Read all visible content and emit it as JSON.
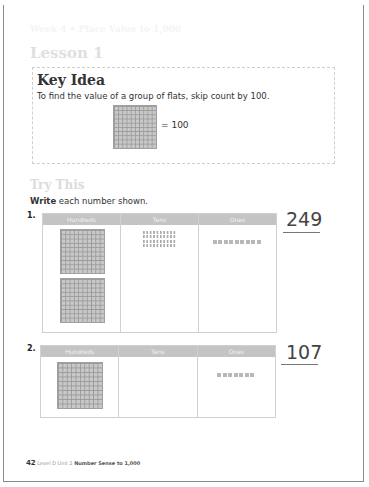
{
  "header": {
    "banner": "Week 4 • Place Value to 1,000",
    "lesson_title": "Lesson 1"
  },
  "key_idea": {
    "title": "Key Idea",
    "text": "To find the value of a group of flats, skip count by 100.",
    "equation": "= 100"
  },
  "try_this": {
    "title": "Try This",
    "instruction_bold": "Write",
    "instruction_rest": " each number shown."
  },
  "columns": [
    "Hundreds",
    "Tens",
    "Ones"
  ],
  "problems": [
    {
      "number": "1.",
      "hundreds": 2,
      "tens": 4,
      "ones": 9,
      "answer": "249"
    },
    {
      "number": "2.",
      "hundreds": 1,
      "tens": 0,
      "ones": 7,
      "answer": "107"
    }
  ],
  "footer": {
    "page": "42",
    "level_unit": "Level D  Unit 2",
    "unit_title": "Number Sense to 1,000"
  },
  "colors": {
    "banner": "#b4b4b4",
    "header_cells": "#c4c4c4",
    "text": "#333333"
  }
}
